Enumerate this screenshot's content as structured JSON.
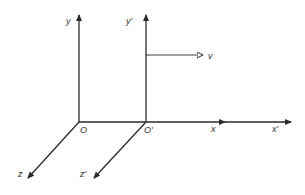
{
  "diagram": {
    "colors": {
      "axis": "#2a2a2a",
      "label": "#333333",
      "background": "#ffffff"
    },
    "frame_S": {
      "origin_label": "O",
      "x_label": "x",
      "y_label": "y",
      "z_label": "z"
    },
    "frame_S_prime": {
      "origin_label": "O'",
      "x_label": "x'",
      "y_label": "y'",
      "z_label": "z'"
    },
    "velocity": {
      "label": "v"
    }
  }
}
